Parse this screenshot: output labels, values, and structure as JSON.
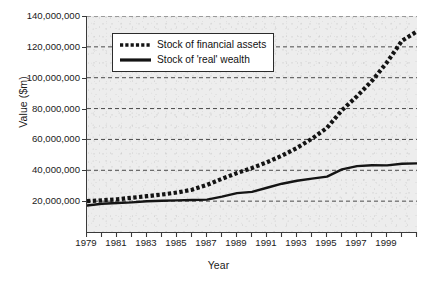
{
  "chart_data": {
    "type": "line",
    "title": "",
    "xlabel": "Year",
    "ylabel": "Value ($m)",
    "xlim": [
      1979,
      2001
    ],
    "ylim": [
      0,
      140000000
    ],
    "grid": true,
    "legend_position": "top-left-inside",
    "y_ticks": [
      "20,000,000",
      "40,000,000",
      "60,000,000",
      "80,000,000",
      "100,000,000",
      "120,000,000",
      "140,000,000"
    ],
    "y_tick_values": [
      20000000,
      40000000,
      60000000,
      80000000,
      100000000,
      120000000,
      140000000
    ],
    "x_ticks_all": [
      1979,
      1980,
      1981,
      1982,
      1983,
      1984,
      1985,
      1986,
      1987,
      1988,
      1989,
      1990,
      1991,
      1992,
      1993,
      1994,
      1995,
      1996,
      1997,
      1998,
      1999,
      2000,
      2001
    ],
    "x_tick_labels": [
      "1979",
      "1981",
      "1983",
      "1985",
      "1987",
      "1989",
      "1991",
      "1993",
      "1995",
      "1997",
      "1999"
    ],
    "x_tick_label_values": [
      1979,
      1981,
      1983,
      1985,
      1987,
      1989,
      1991,
      1993,
      1995,
      1997,
      1999
    ],
    "x": [
      1979,
      1980,
      1981,
      1982,
      1983,
      1984,
      1985,
      1986,
      1987,
      1988,
      1989,
      1990,
      1991,
      1992,
      1993,
      1994,
      1995,
      1996,
      1997,
      1998,
      1999,
      2000,
      2001
    ],
    "series": [
      {
        "name": "Stock of financial assets",
        "style": "dotted",
        "color": "#141414",
        "values": [
          20000000,
          20500000,
          21200000,
          22200000,
          23200000,
          24300000,
          25600000,
          27400000,
          30500000,
          34500000,
          38200000,
          41500000,
          45200000,
          49500000,
          54500000,
          60500000,
          67500000,
          79000000,
          88000000,
          98000000,
          110000000,
          124000000,
          130000000
        ]
      },
      {
        "name": "Stock of 'real' wealth",
        "style": "solid",
        "color": "#141414",
        "values": [
          17200000,
          18300000,
          18800000,
          19200000,
          19900000,
          20300000,
          20500000,
          20700000,
          21000000,
          22900000,
          25200000,
          26000000,
          28700000,
          31300000,
          33200000,
          34600000,
          35900000,
          40600000,
          42700000,
          43300000,
          43200000,
          44200000,
          44500000
        ]
      }
    ]
  },
  "legend": {
    "items": [
      {
        "label": "Stock of financial assets",
        "marker": "dotted-line-swatch"
      },
      {
        "label": "Stock of 'real' wealth",
        "marker": "solid-line-swatch"
      }
    ]
  }
}
